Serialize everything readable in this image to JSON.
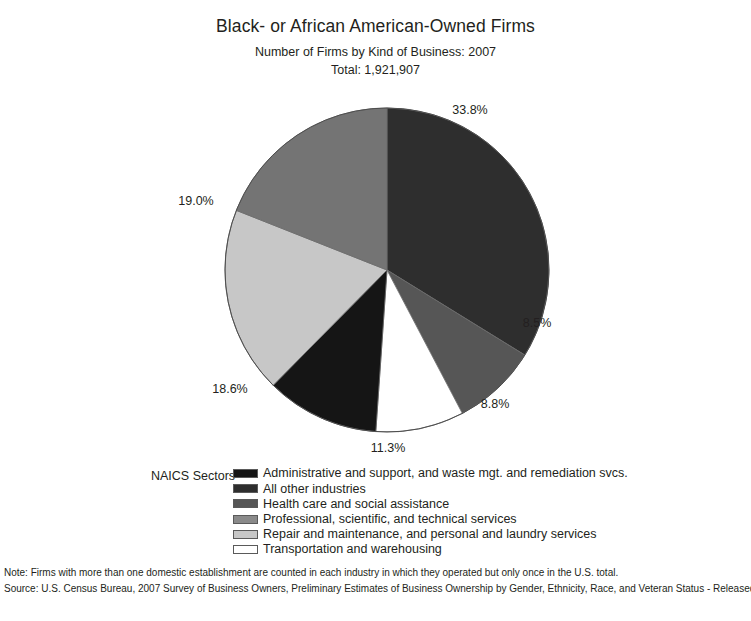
{
  "header": {
    "title": "Black- or African American-Owned Firms",
    "subtitle": "Number of Firms by Kind of Business: 2007",
    "total": "Total: 1,921,907"
  },
  "legend": {
    "title": "NAICS Sectors",
    "items": [
      {
        "label": "Administrative and support, and waste mgt. and remediation svcs.",
        "color": "#151515"
      },
      {
        "label": "All other industries",
        "color": "#2e2e2e"
      },
      {
        "label": "Health care and social assistance",
        "color": "#565656"
      },
      {
        "label": "Professional, scientific, and technical services",
        "color": "#8a8a8a"
      },
      {
        "label": "Repair and maintenance, and personal and laundry services",
        "color": "#c7c7c7"
      },
      {
        "label": "Transportation and warehousing",
        "color": "#ffffff"
      }
    ]
  },
  "footnotes": [
    "Note: Firms with more than one domestic establishment are counted in each industry in which they operated but only once in the U.S. total.",
    "Source: U.S. Census Bureau, 2007 Survey of Business Owners, Preliminary Estimates of Business Ownership by Gender, Ethnicity, Race, and Veteran Status - Released July 13, 2010"
  ],
  "chart_data": {
    "type": "pie",
    "title": "Black- or African American-Owned Firms",
    "subtitle": "Number of Firms by Kind of Business: 2007",
    "total_label": "Total: 1,921,907",
    "total_value": 1921907,
    "unit": "percent",
    "legend_position": "bottom",
    "start_angle_deg": -90,
    "direction": "clockwise",
    "categories": [
      "All other industries",
      "Health care and social assistance",
      "Transportation and warehousing",
      "Administrative and support, and waste mgt. and remediation svcs.",
      "Repair and maintenance, and personal and laundry services",
      "Professional, scientific, and technical services"
    ],
    "values": [
      33.8,
      8.5,
      8.8,
      11.3,
      18.6,
      19.0
    ],
    "colors": [
      "#2e2e2e",
      "#565656",
      "#ffffff",
      "#151515",
      "#c7c7c7",
      "#747474"
    ],
    "labels": [
      "33.8%",
      "8.5%",
      "8.8%",
      "11.3%",
      "18.6%",
      "19.0%"
    ],
    "label_positions": [
      {
        "x": 470,
        "y": 110
      },
      {
        "x": 537,
        "y": 323
      },
      {
        "x": 495,
        "y": 404
      },
      {
        "x": 388,
        "y": 448
      },
      {
        "x": 230,
        "y": 389
      },
      {
        "x": 196,
        "y": 201
      }
    ]
  }
}
